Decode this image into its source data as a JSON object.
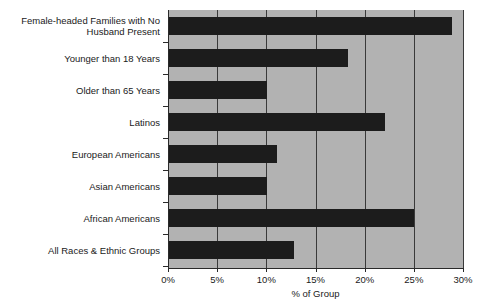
{
  "chart_data": {
    "type": "bar",
    "orientation": "horizontal",
    "title": "",
    "xlabel": "% of Group",
    "ylabel": "",
    "xlim": [
      0,
      30
    ],
    "xticks": [
      "0%",
      "5%",
      "10%",
      "15%",
      "20%",
      "25%",
      "30%"
    ],
    "xtick_values": [
      0,
      5,
      10,
      15,
      20,
      25,
      30
    ],
    "grid": "vertical",
    "legend": "none",
    "bar_color": "#1c1c1c",
    "plot_background": "#b2b2b2",
    "categories": [
      "Female-headed Families with No\nHusband Present",
      "Younger than 18 Years",
      "Older than 65 Years",
      "Latinos",
      "European Americans",
      "Asian Americans",
      "African Americans",
      "All Races & Ethnic Groups"
    ],
    "values": [
      28.8,
      18.2,
      10.0,
      22.0,
      11.0,
      10.0,
      24.9,
      12.7
    ]
  }
}
